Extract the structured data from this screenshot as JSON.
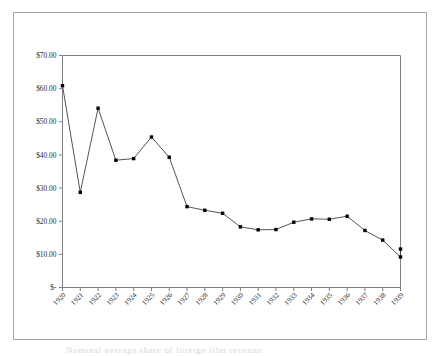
{
  "figure": {
    "background_color": "#ffffff",
    "frame_color": "#a6a6a6",
    "plot_border_color": "#808080",
    "line_color": "#404040",
    "marker_color": "#000000",
    "caption_sliver": "Nominal average share of foreign film revenue"
  },
  "chart_data": {
    "type": "line",
    "title": "",
    "subtitle": "",
    "xlabel": "",
    "ylabel": "",
    "grid": false,
    "legend": "none",
    "x": [
      1920,
      1921,
      1922,
      1923,
      1924,
      1925,
      1926,
      1927,
      1928,
      1929,
      1930,
      1931,
      1932,
      1933,
      1934,
      1935,
      1936,
      1937,
      1938,
      1939
    ],
    "categories": [
      "1920",
      "1921",
      "1922",
      "1923",
      "1924",
      "1925",
      "1926",
      "1927",
      "1928",
      "1929",
      "1930",
      "1931",
      "1932",
      "1933",
      "1934",
      "1935",
      "1936",
      "1937",
      "1938",
      "1939"
    ],
    "values": [
      60.9,
      28.7,
      54.1,
      38.4,
      38.9,
      45.4,
      39.3,
      24.4,
      23.3,
      22.4,
      18.3,
      17.4,
      17.5,
      19.7,
      20.7,
      20.6,
      21.5,
      17.2,
      14.3,
      9.2
    ],
    "values_extra_note": "",
    "series": [
      {
        "name": "value",
        "values": [
          60.9,
          28.7,
          54.1,
          38.4,
          38.9,
          45.4,
          39.3,
          24.4,
          23.3,
          22.4,
          18.3,
          17.4,
          17.5,
          19.7,
          20.7,
          20.6,
          21.5,
          17.2,
          14.3,
          9.2
        ]
      }
    ],
    "final_segment_value": 11.6,
    "ylim": [
      0,
      70
    ],
    "xlim": [
      1920,
      1939
    ],
    "ytick_values": [
      0,
      10,
      20,
      30,
      40,
      50,
      60,
      70
    ],
    "ytick_labels": [
      "$-",
      "$10.00",
      "$20.00",
      "$30.00",
      "$40.00",
      "$50.00",
      "$60.00",
      "$70.00"
    ],
    "xtick_labels": [
      "1920",
      "1921",
      "1922",
      "1923",
      "1924",
      "1925",
      "1926",
      "1927",
      "1928",
      "1929",
      "1930",
      "1931",
      "1932",
      "1933",
      "1934",
      "1935",
      "1936",
      "1937",
      "1938",
      "1939"
    ]
  }
}
